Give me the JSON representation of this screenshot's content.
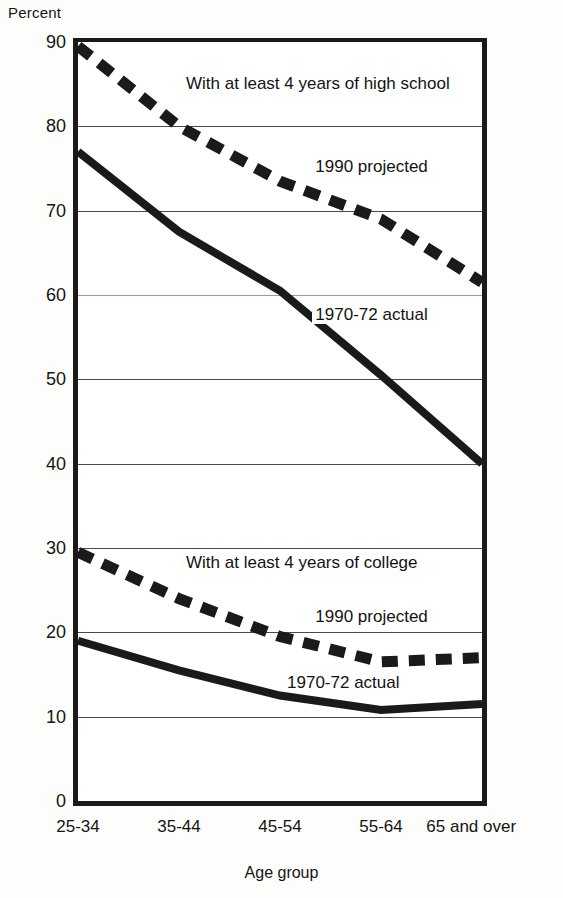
{
  "chart_data": {
    "type": "line",
    "title": "",
    "xlabel": "Age group",
    "ylabel": "Percent",
    "categories": [
      "25-34",
      "35-44",
      "45-54",
      "55-64",
      "65 and over"
    ],
    "ylim": [
      0,
      90
    ],
    "ytick_labels": [
      "90",
      "80",
      "70",
      "60",
      "50",
      "40",
      "30",
      "20",
      "10",
      "0"
    ],
    "ytick_values": [
      90,
      80,
      70,
      60,
      50,
      40,
      30,
      20,
      10,
      0
    ],
    "grid": true,
    "legend_position": "inline-annotations",
    "series": [
      {
        "name": "With at least 4 years of high school, 1990 projected",
        "group": "high school",
        "style": "dashed",
        "values": [
          89.5,
          80.0,
          73.5,
          69.0,
          61.5
        ]
      },
      {
        "name": "With at least 4 years of high school, 1970-72 actual",
        "group": "high school",
        "style": "solid",
        "values": [
          77.0,
          67.5,
          60.5,
          50.5,
          40.0
        ]
      },
      {
        "name": "With at least 4 years of college, 1990 projected",
        "group": "college",
        "style": "dashed",
        "values": [
          29.5,
          24.0,
          19.5,
          16.5,
          17.0
        ]
      },
      {
        "name": "With at least 4 years of college, 1970-72 actual",
        "group": "college",
        "style": "solid",
        "values": [
          19.0,
          15.5,
          12.5,
          10.8,
          11.5
        ]
      }
    ],
    "annotations": [
      {
        "text": "With at least 4 years of high school",
        "x_pct": 26,
        "y_value": 85.0
      },
      {
        "text": "1990 projected",
        "x_pct": 58,
        "y_value": 75.2
      },
      {
        "text": "1970-72 actual",
        "x_pct": 58,
        "y_value": 57.6
      },
      {
        "text": "With at least 4 years of college",
        "x_pct": 26,
        "y_value": 28.2
      },
      {
        "text": "1990 projected",
        "x_pct": 58,
        "y_value": 21.8
      },
      {
        "text": "1970-72 actual",
        "x_pct": 51,
        "y_value": 14.0
      }
    ],
    "colors": {
      "ink": "#1a1a1a",
      "grid": "#4a4a4a",
      "grid_tinted": "#b98d8d",
      "background": "#ffffff"
    }
  }
}
